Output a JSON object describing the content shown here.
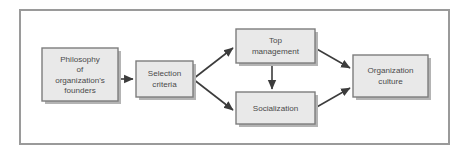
{
  "figure": {
    "frame": {
      "border_color": "#9a9a9a"
    },
    "style": {
      "node_fill": "#e9e9e9",
      "node_border": "#7d7d7d",
      "node_shadow": "#b4b4b4",
      "text_color": "#4a4a4a",
      "arrow_color": "#3c3c3c",
      "background": "#ffffff"
    },
    "nodes": [
      {
        "id": "philosophy",
        "lines": [
          "Philosophy",
          "of",
          "organization's",
          "founders"
        ],
        "x": 42,
        "y": 48,
        "w": 76,
        "h": 53
      },
      {
        "id": "selection",
        "lines": [
          "Selection",
          "criteria"
        ],
        "x": 136,
        "y": 61,
        "w": 57,
        "h": 36
      },
      {
        "id": "top-management",
        "lines": [
          "Top",
          "management"
        ],
        "x": 236,
        "y": 29,
        "w": 79,
        "h": 34
      },
      {
        "id": "socialization",
        "lines": [
          "Socialization"
        ],
        "x": 236,
        "y": 92,
        "w": 79,
        "h": 32
      },
      {
        "id": "organization-culture",
        "lines": [
          "Organization",
          "culture"
        ],
        "x": 353,
        "y": 55,
        "w": 75,
        "h": 42
      }
    ],
    "connectors": [
      {
        "id": "philosophy-to-selection",
        "from": "philosophy",
        "to": "selection",
        "kind": "arrow-right"
      },
      {
        "id": "selection-to-top-management",
        "from": "selection",
        "to": "top-management",
        "kind": "arrow-up-right"
      },
      {
        "id": "selection-to-socialization",
        "from": "selection",
        "to": "socialization",
        "kind": "arrow-down-right"
      },
      {
        "id": "top-management-to-socialization",
        "from": "top-management",
        "to": "socialization",
        "kind": "arrow-down"
      },
      {
        "id": "top-management-to-culture",
        "from": "top-management",
        "to": "organization-culture",
        "kind": "arrow-down-right"
      },
      {
        "id": "socialization-to-culture",
        "from": "socialization",
        "to": "organization-culture",
        "kind": "arrow-up-right"
      }
    ]
  }
}
